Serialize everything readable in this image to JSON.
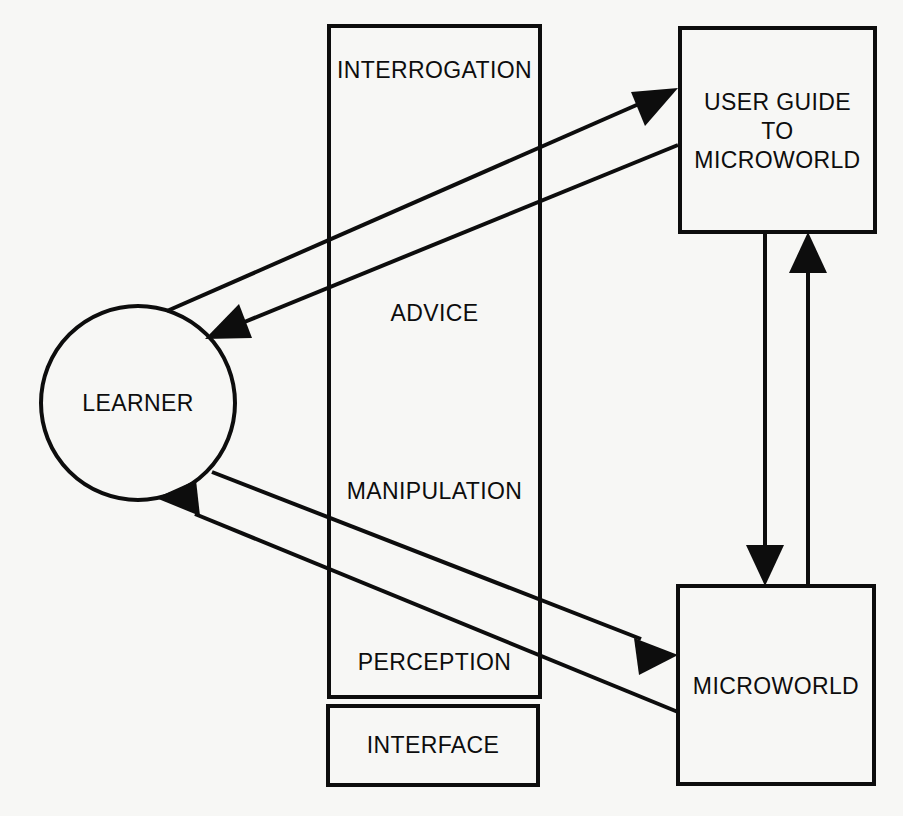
{
  "diagram": {
    "background_color": "#f7f7f5",
    "stroke_color": "#0d0d0d",
    "nodes": {
      "learner": {
        "label": "LEARNER",
        "shape": "circle",
        "cx": 138,
        "cy": 403,
        "r": 97
      },
      "interface_container": {
        "label": "",
        "shape": "rect",
        "x": 329,
        "y": 26,
        "w": 211,
        "h": 671
      },
      "interface_box": {
        "label": "INTERFACE",
        "shape": "rect",
        "x": 328,
        "y": 706,
        "w": 210,
        "h": 79
      },
      "user_guide": {
        "label": "USER GUIDE\nTO\nMICROWORLD",
        "shape": "rect",
        "x": 680,
        "y": 28,
        "w": 195,
        "h": 204
      },
      "microworld": {
        "label": "MICROWORLD",
        "shape": "rect",
        "x": 678,
        "y": 586,
        "w": 196,
        "h": 198
      }
    },
    "edge_labels": {
      "interrogation": {
        "text": "INTERROGATION",
        "x": 434,
        "y": 71
      },
      "advice": {
        "text": "ADVICE",
        "x": 434,
        "y": 314
      },
      "manipulation": {
        "text": "MANIPULATION",
        "x": 434,
        "y": 492
      },
      "perception": {
        "text": "PERCEPTION",
        "x": 434,
        "y": 663
      }
    },
    "edges": [
      {
        "name": "interrogation",
        "from": "learner",
        "to": "user_guide",
        "direction": "to-user-guide"
      },
      {
        "name": "advice",
        "from": "user_guide",
        "to": "learner",
        "direction": "to-learner"
      },
      {
        "name": "manipulation",
        "from": "learner",
        "to": "microworld",
        "direction": "to-microworld"
      },
      {
        "name": "perception",
        "from": "microworld",
        "to": "learner",
        "direction": "to-learner"
      },
      {
        "name": "guide-to-microworld",
        "from": "user_guide",
        "to": "microworld",
        "direction": "down"
      },
      {
        "name": "microworld-to-guide",
        "from": "microworld",
        "to": "user_guide",
        "direction": "up"
      }
    ]
  }
}
